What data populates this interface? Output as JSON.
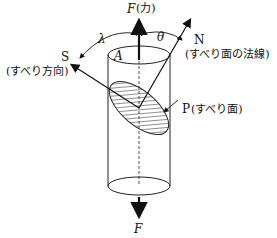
{
  "diagram": {
    "force_top": {
      "symbol": "F",
      "note": "(力)"
    },
    "force_bottom": {
      "symbol": "F"
    },
    "area_label": "A",
    "angle_lambda": "λ",
    "angle_theta": "θ",
    "slip_direction": {
      "symbol": "S",
      "note": "(すべり方向)"
    },
    "slip_normal": {
      "symbol": "N",
      "note": "(すべり面の法線)"
    },
    "slip_plane": {
      "symbol": "P",
      "note": "(すべり面)"
    }
  }
}
